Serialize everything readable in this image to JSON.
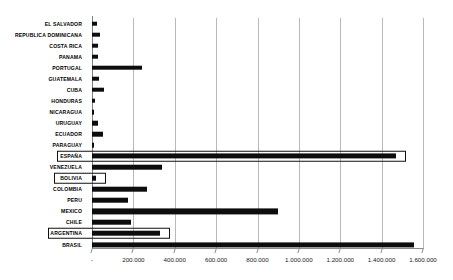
{
  "chart_data": {
    "type": "bar",
    "orientation": "horizontal",
    "title": "",
    "subtitle": "",
    "xlabel": "",
    "ylabel": "",
    "xlim": [
      0,
      1600000
    ],
    "grid": true,
    "legend": null,
    "axis_tick_labels": [
      "-",
      "200.000",
      "400.000",
      "600.000",
      "800.000",
      "1.000.000",
      "1.200.000",
      "1.400.000",
      "1.600.000"
    ],
    "axis_tick_values": [
      0,
      200000,
      400000,
      600000,
      800000,
      1000000,
      1200000,
      1400000,
      1600000
    ],
    "categories": [
      "EL SALVADOR",
      "REPUBLICA DOMINICANA",
      "COSTA RICA",
      "PANAMA",
      "PORTUGAL",
      "GUATEMALA",
      "CUBA",
      "HONDURAS",
      "NICARAGUA",
      "URUGUAY",
      "ECUADOR",
      "PARAGUAY",
      "ESPAÑA",
      "VENEZUELA",
      "BOLIVIA",
      "COLOMBIA",
      "PERU",
      "MEXICO",
      "CHILE",
      "ARGENTINA",
      "BRASIL"
    ],
    "values": [
      25000,
      40000,
      28000,
      30000,
      240000,
      33000,
      57000,
      14000,
      10000,
      30000,
      55000,
      12000,
      1470000,
      340000,
      20000,
      265000,
      175000,
      900000,
      190000,
      330000,
      1555000
    ],
    "highlighted": [
      "ESPAÑA",
      "BOLIVIA",
      "ARGENTINA"
    ],
    "bar_color": "#0d0d0d",
    "highlight_border_color": "#111111",
    "gridline_color": "#b9b9b9",
    "axis_color": "#8a8a8a"
  }
}
